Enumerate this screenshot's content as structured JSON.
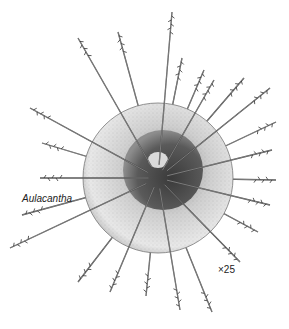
{
  "figure": {
    "label": "Aulacantha",
    "magnification": "×25"
  },
  "illustration": {
    "center": [
      158,
      178
    ],
    "sphere_radius": 75,
    "nucleus_center": [
      163,
      170
    ],
    "nucleus_radius": 40,
    "spines": [
      [
        78,
        38
      ],
      [
        118,
        32
      ],
      [
        172,
        12
      ],
      [
        182,
        58
      ],
      [
        214,
        80
      ],
      [
        244,
        78
      ],
      [
        270,
        88
      ],
      [
        276,
        122
      ],
      [
        272,
        150
      ],
      [
        276,
        180
      ],
      [
        270,
        205
      ],
      [
        258,
        232
      ],
      [
        240,
        262
      ],
      [
        212,
        312
      ],
      [
        180,
        310
      ],
      [
        146,
        296
      ],
      [
        110,
        292
      ],
      [
        78,
        282
      ],
      [
        10,
        248
      ],
      [
        22,
        215
      ],
      [
        40,
        178
      ],
      [
        42,
        143
      ],
      [
        30,
        108
      ],
      [
        204,
        70
      ]
    ],
    "colors": {
      "ink": "#2a2a2a",
      "sphere": "#d9d9d9",
      "nucleus": "#555555"
    }
  }
}
